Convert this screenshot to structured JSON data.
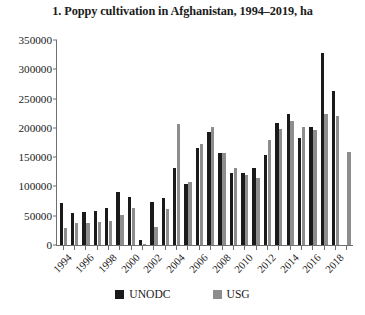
{
  "chart_data": {
    "type": "bar",
    "title": "1. Poppy cultivation in Afghanistan, 1994–2019, ha",
    "xlabel": "",
    "ylabel": "",
    "ylim": [
      0,
      350000
    ],
    "ytick_step": 50000,
    "ytick_labels": [
      "350000",
      "300000",
      "250000",
      "200000",
      "150000",
      "100000",
      "50000",
      "0"
    ],
    "ytick_values": [
      350000,
      300000,
      250000,
      200000,
      150000,
      100000,
      50000,
      0
    ],
    "grid": false,
    "legend_position": "bottom",
    "categories": [
      "1994",
      "1995",
      "1996",
      "1997",
      "1998",
      "1999",
      "2000",
      "2001",
      "2002",
      "2003",
      "2004",
      "2005",
      "2006",
      "2007",
      "2008",
      "2009",
      "2010",
      "2011",
      "2012",
      "2013",
      "2014",
      "2015",
      "2016",
      "2017",
      "2018",
      "2019"
    ],
    "tick_labels": [
      "1994",
      "",
      "1996",
      "",
      "1998",
      "",
      "2000",
      "",
      "2002",
      "",
      "2004",
      "",
      "2006",
      "",
      "2008",
      "",
      "2010",
      "",
      "2012",
      "",
      "2014",
      "",
      "2016",
      "",
      "2018",
      ""
    ],
    "series": [
      {
        "name": "UNODC",
        "color": "#1a1a1a",
        "values": [
          71000,
          54000,
          57000,
          58000,
          64000,
          91000,
          82000,
          8000,
          74000,
          80000,
          131000,
          104000,
          165000,
          193000,
          157000,
          123000,
          123000,
          131000,
          154000,
          209000,
          224000,
          183000,
          201000,
          328000,
          263000,
          null
        ]
      },
      {
        "name": "USG",
        "color": "#8d8d8d",
        "values": [
          29000,
          38000,
          37000,
          39000,
          41000,
          51000,
          64000,
          1685,
          30750,
          61000,
          206700,
          107400,
          172600,
          202000,
          157000,
          131000,
          119000,
          115000,
          180000,
          198000,
          211000,
          201000,
          196000,
          224000,
          221000,
          158000
        ]
      }
    ]
  },
  "legend": {
    "entries": [
      {
        "label": "UNODC",
        "color": "#1a1a1a"
      },
      {
        "label": "USG",
        "color": "#8d8d8d"
      }
    ]
  }
}
